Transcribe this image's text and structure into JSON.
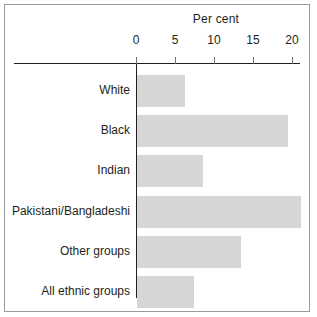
{
  "chart_data": {
    "type": "bar",
    "orientation": "horizontal",
    "title": "",
    "xlabel": "Per cent",
    "ylabel": "",
    "xlim": [
      0,
      22
    ],
    "xticks": [
      0,
      5,
      10,
      15,
      20
    ],
    "xtick_labels": [
      "0",
      "5",
      "10",
      "15",
      "20"
    ],
    "grid": false,
    "legend": null,
    "bar_color": "#d6d6d6",
    "axis_color": "#231f20",
    "categories": [
      "White",
      "Black",
      "Indian",
      "Pakistani/Bangladeshi",
      "Other groups",
      "All ethnic groups"
    ],
    "values": [
      6.2,
      19.3,
      8.4,
      21.0,
      13.3,
      7.3
    ]
  },
  "axis": {
    "title": "Per cent"
  }
}
